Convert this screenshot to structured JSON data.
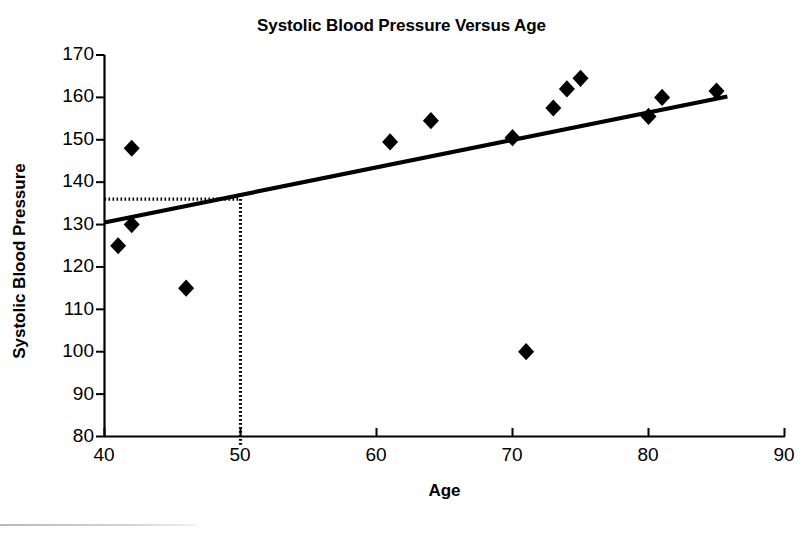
{
  "chart_data": {
    "type": "scatter",
    "title": "Systolic Blood Pressure Versus Age",
    "xlabel": "Age",
    "ylabel": "Systolic Blood Pressure",
    "xlim": [
      40,
      90
    ],
    "ylim": [
      80,
      170
    ],
    "xticks": [
      40,
      50,
      60,
      70,
      80,
      90
    ],
    "yticks": [
      80,
      90,
      100,
      110,
      120,
      130,
      140,
      150,
      160,
      170
    ],
    "grid": false,
    "legend": false,
    "marker": "filled-diamond",
    "marker_color": "#000000",
    "points": [
      {
        "x": 41,
        "y": 125
      },
      {
        "x": 42,
        "y": 148
      },
      {
        "x": 42,
        "y": 130
      },
      {
        "x": 46,
        "y": 115
      },
      {
        "x": 61,
        "y": 149.5
      },
      {
        "x": 64,
        "y": 154.5
      },
      {
        "x": 70,
        "y": 150.5
      },
      {
        "x": 71,
        "y": 100
      },
      {
        "x": 73,
        "y": 157.5
      },
      {
        "x": 74,
        "y": 162
      },
      {
        "x": 75,
        "y": 164.5
      },
      {
        "x": 80,
        "y": 155.5
      },
      {
        "x": 81,
        "y": 160
      },
      {
        "x": 85,
        "y": 161.5
      }
    ],
    "trend_line": {
      "type": "line",
      "style": "solid",
      "color": "#000000",
      "x_start": 40,
      "y_start": 130.5,
      "x_end": 85.8,
      "y_end": 160.2
    },
    "reference_lines": [
      {
        "orientation": "horizontal",
        "style": "dotted",
        "value": 136,
        "from_x": 40,
        "to_x": 50,
        "label": ""
      },
      {
        "orientation": "vertical",
        "style": "dotted",
        "value": 50,
        "from_y": 136,
        "to_y": 78,
        "label": ""
      }
    ],
    "annotations": []
  },
  "axes": {
    "y_tick_labels": [
      "170",
      "160",
      "150",
      "140",
      "130",
      "120",
      "110",
      "100",
      "90",
      "80"
    ],
    "x_tick_labels": [
      "40",
      "50",
      "60",
      "70",
      "80",
      "90"
    ]
  }
}
